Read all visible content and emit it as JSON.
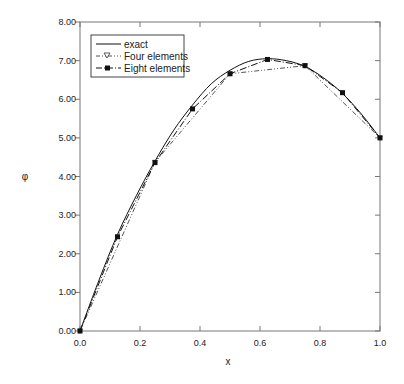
{
  "chart_data": {
    "type": "line",
    "title": "",
    "xlabel": "x",
    "ylabel": "φ",
    "xlim": [
      0,
      1
    ],
    "ylim": [
      0,
      8
    ],
    "grid": false,
    "legend_position": "upper-left",
    "x_ticks": [
      "0.0",
      "0.2",
      "0.4",
      "0.6",
      "0.8",
      "1.0"
    ],
    "y_ticks": [
      "0.00",
      "1.00",
      "2.00",
      "3.00",
      "4.00",
      "5.00",
      "6.00",
      "7.00",
      "8.00"
    ],
    "series": [
      {
        "name": "exact",
        "style": "solid",
        "marker": "none",
        "x": [
          0,
          0.0625,
          0.125,
          0.1875,
          0.25,
          0.3125,
          0.375,
          0.4375,
          0.5,
          0.5625,
          0.625,
          0.6875,
          0.75,
          0.8125,
          0.875,
          0.9375,
          1.0
        ],
        "values": [
          0,
          1.3,
          2.5,
          3.5,
          4.4,
          5.2,
          5.85,
          6.4,
          6.75,
          6.98,
          7.05,
          7.0,
          6.85,
          6.55,
          6.15,
          5.62,
          5.0
        ]
      },
      {
        "name": "Four elements",
        "style": "dash-dot-dot",
        "marker": "triangle-down-open",
        "x": [
          0,
          0.25,
          0.5,
          0.75,
          1.0
        ],
        "values": [
          0,
          4.37,
          6.66,
          6.87,
          5.0
        ]
      },
      {
        "name": "Eight elements",
        "style": "dash-dot",
        "marker": "square-filled",
        "x": [
          0,
          0.125,
          0.25,
          0.375,
          0.5,
          0.625,
          0.75,
          0.875,
          1.0
        ],
        "values": [
          0,
          2.44,
          4.36,
          5.75,
          6.66,
          7.03,
          6.87,
          6.17,
          5.0
        ]
      }
    ]
  },
  "legend": {
    "items": [
      "exact",
      "Four elements",
      "Eight elements"
    ]
  }
}
